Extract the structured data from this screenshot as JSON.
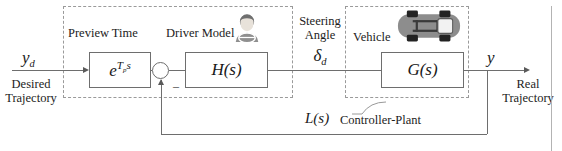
{
  "figure": {
    "type": "control-block-diagram"
  },
  "regions": [
    {
      "id": "driver",
      "label": ""
    },
    {
      "id": "vehicle",
      "label": ""
    }
  ],
  "labels": {
    "preview_time": "Preview Time",
    "driver_model": "Driver Model",
    "steering_angle_line1": "Steering",
    "steering_angle_line2": "Angle",
    "steering_angle_symbol_base": "δ",
    "steering_angle_symbol_sub": "d",
    "vehicle": "Vehicle",
    "controller_plant": "Controller-Plant"
  },
  "inputs": {
    "signal_symbol_base": "y",
    "signal_symbol_sub": "d",
    "desc_line1": "Desired",
    "desc_line2": "Trajectory"
  },
  "outputs": {
    "signal_symbol": "y",
    "desc_line1": "Real",
    "desc_line2": "Trajectory"
  },
  "blocks": {
    "preview": {
      "name": "preview-time-block",
      "expr_base": "e",
      "expr_exp_base": "T",
      "expr_exp_sub": "p",
      "expr_exp_tail": "s"
    },
    "driver": {
      "name": "driver-model-block",
      "expr": "H(s)"
    },
    "vehicle": {
      "name": "vehicle-block",
      "expr": "G(s)"
    }
  },
  "summing_junction": {
    "name": "summing-junction",
    "negative_sign": "–"
  },
  "feedback": {
    "transfer_function": "L(s)",
    "description": "Controller-Plant"
  },
  "icons": {
    "driver": "driver-avatar-icon",
    "vehicle": "car-top-view-icon"
  },
  "colors": {
    "line": "#6e6e6e",
    "dashed": "#9a9a9a",
    "text": "#1c1c1c",
    "block_border": "#6e6e6e",
    "car_body": "#8a8a8a",
    "driver_fill": "#9b9b9b"
  }
}
